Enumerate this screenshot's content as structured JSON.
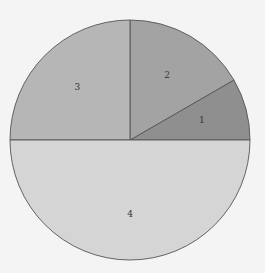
{
  "chart_data": {
    "type": "pie",
    "title": "",
    "categories": [
      "1",
      "2",
      "3",
      "4"
    ],
    "values": [
      1,
      2,
      3,
      6
    ],
    "labels": [
      "1",
      "2",
      "3",
      "4"
    ],
    "colors": [
      "#8f8f8f",
      "#a3a3a3",
      "#b6b6b6",
      "#d5d5d5"
    ],
    "start_angle_deg": 0,
    "direction": "counterclockwise",
    "legend": "none",
    "center": [
      130,
      140
    ],
    "radius": 120
  }
}
